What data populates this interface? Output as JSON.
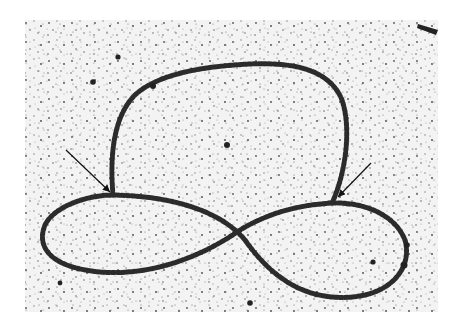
{
  "image": {
    "subject": "electron micrograph of circular DNA molecule with beaded chromatin",
    "background_color": "#ffffff",
    "field_color": "#f2f2f2",
    "strand_color": "#2a2a2a",
    "arrows": [
      {
        "from": [
          66,
          150
        ],
        "to": [
          113,
          195
        ]
      },
      {
        "from": [
          371,
          163
        ],
        "to": [
          335,
          200
        ]
      }
    ]
  }
}
